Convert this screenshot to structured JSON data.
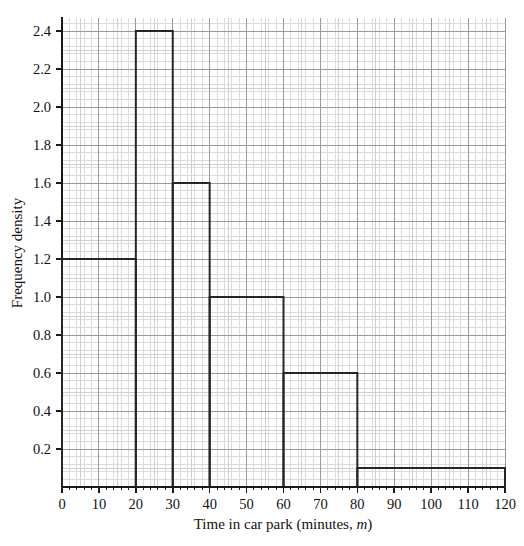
{
  "chart_data": {
    "type": "bar",
    "title": "",
    "xlabel": "Time in car park (minutes, m)",
    "xlabel_plain": "Time in car park (minutes, ",
    "xlabel_italic": "m",
    "xlabel_tail": ")",
    "ylabel": "Frequency density",
    "xlim": [
      0,
      120
    ],
    "ylim": [
      0,
      2.45
    ],
    "grid": "graph-paper",
    "legend": "none",
    "x_tick_labels": [
      "0",
      "10",
      "20",
      "30",
      "40",
      "50",
      "60",
      "70",
      "80",
      "90",
      "100",
      "110",
      "120"
    ],
    "x_ticks": [
      0,
      10,
      20,
      30,
      40,
      50,
      60,
      70,
      80,
      90,
      100,
      110,
      120
    ],
    "x_minor_step": 2,
    "y_tick_labels": [
      "0.2",
      "0.4",
      "0.6",
      "0.8",
      "1.0",
      "1.2",
      "1.4",
      "1.6",
      "1.8",
      "2.0",
      "2.2",
      "2.4"
    ],
    "y_ticks": [
      0.2,
      0.4,
      0.6,
      0.8,
      1.0,
      1.2,
      1.4,
      1.6,
      1.8,
      2.0,
      2.2,
      2.4
    ],
    "y_minor_step": 0.04,
    "bins": [
      {
        "label": "0 - 20",
        "x0": 0,
        "x1": 20,
        "value": 1.2
      },
      {
        "label": "20 - 30",
        "x0": 20,
        "x1": 30,
        "value": 2.4
      },
      {
        "label": "30 - 40",
        "x0": 30,
        "x1": 40,
        "value": 1.6
      },
      {
        "label": "40 - 60",
        "x0": 40,
        "x1": 60,
        "value": 1.0
      },
      {
        "label": "60 - 80",
        "x0": 60,
        "x1": 80,
        "value": 0.6
      },
      {
        "label": "80 - 120",
        "x0": 80,
        "x1": 120,
        "value": 0.1
      }
    ],
    "categories": [
      "0 - 20",
      "20 - 30",
      "30 - 40",
      "40 - 60",
      "60 - 80",
      "80 - 120"
    ],
    "values": [
      1.2,
      2.4,
      1.6,
      1.0,
      0.6,
      0.1
    ],
    "colors": {
      "bar_stroke": "#262626",
      "bar_fill": "none",
      "axis": "#1a1a1a",
      "grid_major": "#9a9a9a",
      "grid_minor": "#dcdcdc",
      "background": "#ffffff",
      "text": "#111111"
    }
  }
}
